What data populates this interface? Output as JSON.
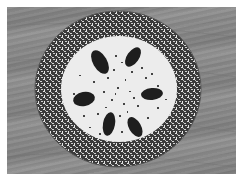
{
  "image": {
    "description": "Grayscale photograph of a round plate with a dark speckled rim on a wooden table; six dark oval food items arranged radially on the white center, with many small dark specks scattered across it",
    "colors": {
      "table": "#888888",
      "rim_dark": "#2a2a2a",
      "rim_light": "#d8d8d8",
      "plate_center": "#ececec",
      "items": "#1e1e1e"
    },
    "items_count": 6
  }
}
